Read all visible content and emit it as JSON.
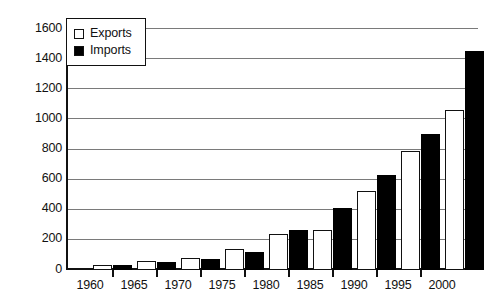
{
  "chart_data": {
    "type": "bar",
    "title": "",
    "subtitle": "",
    "xlabel": "",
    "ylabel": "",
    "categories": [
      "1960",
      "1965",
      "1970",
      "1975",
      "1980",
      "1985",
      "1990",
      "1995",
      "2000"
    ],
    "series": [
      {
        "name": "Exports",
        "color": "#ffffff",
        "values": [
          30,
          60,
          80,
          140,
          240,
          265,
          525,
          790,
          1060
        ]
      },
      {
        "name": "Imports",
        "color": "#000000",
        "values": [
          35,
          50,
          70,
          120,
          265,
          410,
          630,
          900,
          1450
        ]
      }
    ],
    "ylim": [
      0,
      1600
    ],
    "ytick_labels": [
      "0",
      "200",
      "400",
      "600",
      "800",
      "1000",
      "1200",
      "1400",
      "1600"
    ],
    "ytick_values": [
      0,
      200,
      400,
      600,
      800,
      1000,
      1200,
      1400,
      1600
    ],
    "grid": true,
    "legend_position": "top-left",
    "legend_entries": [
      {
        "label": "Exports",
        "swatch": "white-square"
      },
      {
        "label": "Imports",
        "swatch": "black-square"
      }
    ]
  },
  "legend": {
    "exports_label": "Exports",
    "imports_label": "Imports"
  },
  "axes": {
    "y_ticks": [
      "1600",
      "1400",
      "1200",
      "1000",
      "800",
      "600",
      "400",
      "200",
      "0"
    ],
    "x_ticks": [
      "1960",
      "1965",
      "1970",
      "1975",
      "1980",
      "1985",
      "1990",
      "1995",
      "2000"
    ]
  },
  "colors": {
    "exports": "#ffffff",
    "imports": "#000000",
    "axis": "#111111",
    "grid": "#7a7a7a",
    "background": "#ffffff"
  }
}
